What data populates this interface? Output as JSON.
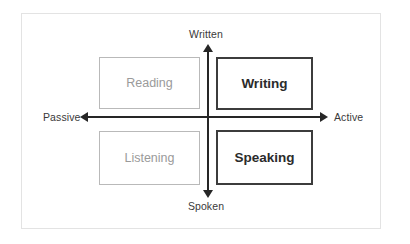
{
  "diagram": {
    "frame": {
      "border_color": "#e3e3e3",
      "background": "#ffffff"
    },
    "axes": {
      "vertical": {
        "name": "medium-axis",
        "top_label": "Written",
        "bottom_label": "Spoken",
        "color": "#262626"
      },
      "horizontal": {
        "name": "mode-axis",
        "left_label": "Passive",
        "right_label": "Active",
        "color": "#262626"
      }
    },
    "quadrants": [
      {
        "id": "reading",
        "label": "Reading",
        "position": "top-left",
        "vertical": "Written",
        "horizontal": "Passive",
        "emphasis": "low",
        "border_color": "#b9b9b9",
        "text_color": "#9a9a9a"
      },
      {
        "id": "writing",
        "label": "Writing",
        "position": "top-right",
        "vertical": "Written",
        "horizontal": "Active",
        "emphasis": "high",
        "border_color": "#3c3c3c",
        "text_color": "#2b2b2b"
      },
      {
        "id": "listening",
        "label": "Listening",
        "position": "bottom-left",
        "vertical": "Spoken",
        "horizontal": "Passive",
        "emphasis": "low",
        "border_color": "#b9b9b9",
        "text_color": "#9a9a9a"
      },
      {
        "id": "speaking",
        "label": "Speaking",
        "position": "bottom-right",
        "vertical": "Spoken",
        "horizontal": "Active",
        "emphasis": "high",
        "border_color": "#3c3c3c",
        "text_color": "#2b2b2b"
      }
    ]
  }
}
